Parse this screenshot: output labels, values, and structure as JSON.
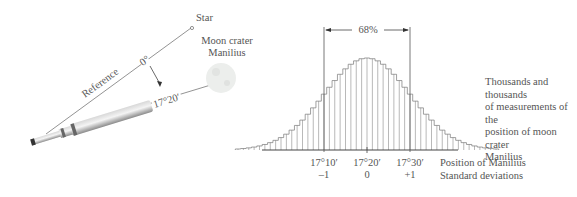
{
  "left_diagram": {
    "star_label": "Star",
    "moon_label_line1": "Moon crater",
    "moon_label_line2": "Manilius",
    "reference_label": "Reference",
    "zero_angle_label": "0°",
    "measured_angle_label": "17°20′",
    "colors": {
      "line": "#777777",
      "telescope": "#b8b8b8",
      "moon": "#e6e8e6"
    }
  },
  "right_diagram": {
    "percent_label": "68%",
    "description_lines": [
      "Thousands and thousands",
      "of measurements of the",
      "position of moon crater",
      "Manilius"
    ],
    "axis_title_position": "Position of Manilius",
    "axis_title_sd": "Standard deviations",
    "ticks": [
      {
        "position": "17°10′",
        "sd": "–1"
      },
      {
        "position": "17°20′",
        "sd": "0"
      },
      {
        "position": "17°30′",
        "sd": "+1"
      }
    ]
  },
  "chart_data": {
    "type": "bar",
    "title": "",
    "xlabel": "Position of Manilius / Standard deviations",
    "ylabel": "",
    "y_unit_note": "No y-axis or count scale is shown in the image; y values are relative frequencies (standard normal density scaled so the peak = 1.0) and represent only the bell shape.",
    "distribution": "normal",
    "mean": "17°20′",
    "sd": "10′",
    "mean_sd_units": 0,
    "x_sd": [
      -3.0,
      -2.875,
      -2.75,
      -2.625,
      -2.5,
      -2.375,
      -2.25,
      -2.125,
      -2.0,
      -1.875,
      -1.75,
      -1.625,
      -1.5,
      -1.375,
      -1.25,
      -1.125,
      -1.0,
      -0.875,
      -0.75,
      -0.625,
      -0.5,
      -0.375,
      -0.25,
      -0.125,
      0.0,
      0.125,
      0.25,
      0.375,
      0.5,
      0.625,
      0.75,
      0.875,
      1.0,
      1.125,
      1.25,
      1.375,
      1.5,
      1.625,
      1.75,
      1.875,
      2.0,
      2.125,
      2.25,
      2.375,
      2.5,
      2.625,
      2.75,
      2.875,
      3.0
    ],
    "relative_frequency": [
      0.011,
      0.016,
      0.023,
      0.032,
      0.044,
      0.06,
      0.08,
      0.105,
      0.135,
      0.172,
      0.216,
      0.267,
      0.325,
      0.389,
      0.458,
      0.531,
      0.607,
      0.682,
      0.755,
      0.823,
      0.882,
      0.932,
      0.969,
      0.992,
      1.0,
      0.992,
      0.969,
      0.932,
      0.882,
      0.823,
      0.755,
      0.682,
      0.607,
      0.531,
      0.458,
      0.389,
      0.325,
      0.267,
      0.216,
      0.172,
      0.135,
      0.105,
      0.08,
      0.06,
      0.044,
      0.032,
      0.023,
      0.016,
      0.011
    ],
    "annotations": [
      {
        "text": "68%",
        "from_sd": -1,
        "to_sd": 1,
        "kind": "bracket"
      }
    ],
    "tick_labels": [
      "17°10′",
      "17°20′",
      "17°30′"
    ],
    "tick_sd_labels": [
      "–1",
      "0",
      "+1"
    ],
    "grid": false,
    "legend": "none"
  }
}
